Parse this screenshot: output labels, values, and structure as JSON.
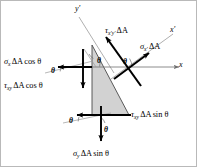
{
  "figure": {
    "type": "mechanics-free-body-diagram",
    "colors": {
      "wedge_fill": "#d2d2d2",
      "wedge_stroke": "#3a3a3a",
      "force_arrow": "#000000",
      "axis_line": "#8a8a8a",
      "thin_line": "#9a9a9a",
      "border": "#b9b9b9",
      "background": "#ffffff"
    }
  },
  "axes": [
    {
      "id": "y-prime",
      "label_greek": "y",
      "label_prime": "′"
    },
    {
      "id": "x-prime",
      "label_greek": "x",
      "label_prime": "′"
    },
    {
      "id": "x",
      "label_greek": "x",
      "label_prime": ""
    }
  ],
  "forces": [
    {
      "id": "sigma-x-dA-cos-theta",
      "symbol": "σ",
      "subscript": "x",
      "area": "ΔA",
      "trig": "cos θ",
      "direction": "left",
      "face": "vertical-left-face"
    },
    {
      "id": "tau-xy-dA-cos-theta",
      "symbol": "τ",
      "subscript": "xy",
      "area": "ΔA",
      "trig": "cos θ",
      "direction": "down",
      "face": "vertical-left-face"
    },
    {
      "id": "tau-xy-dA-sin-theta",
      "symbol": "τ",
      "subscript": "xy",
      "area": "ΔA",
      "trig": "sin θ",
      "direction": "left",
      "face": "horizontal-bottom-face"
    },
    {
      "id": "sigma-y-dA-sin-theta",
      "symbol": "σ",
      "subscript": "y",
      "area": "ΔA",
      "trig": "sin θ",
      "direction": "down",
      "face": "horizontal-bottom-face"
    },
    {
      "id": "sigma-x-prime-dA",
      "symbol": "σ",
      "subscript": "x′",
      "area": "ΔA",
      "trig": "",
      "direction": "along-x-prime",
      "face": "inclined-face"
    },
    {
      "id": "tau-x-prime-y-prime-dA",
      "symbol": "τ",
      "subscript": "x′y′",
      "area": "ΔA",
      "trig": "",
      "direction": "along-y-prime",
      "face": "inclined-face"
    }
  ],
  "angles": [
    {
      "id": "theta-top-left",
      "label": "θ"
    },
    {
      "id": "theta-left",
      "label": "θ"
    },
    {
      "id": "theta-center",
      "label": "θ"
    },
    {
      "id": "theta-x-prime",
      "label": "θ"
    },
    {
      "id": "theta-bottom-left",
      "label": "θ"
    },
    {
      "id": "theta-bottom-mid",
      "label": "θ"
    }
  ]
}
